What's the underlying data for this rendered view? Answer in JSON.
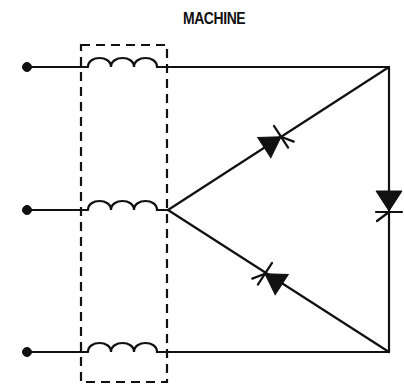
{
  "title": "MACHINE",
  "diagram": {
    "type": "circuit-schematic",
    "components": {
      "terminals": [
        {
          "id": "T1",
          "x": 27,
          "y": 67
        },
        {
          "id": "T2",
          "x": 27,
          "y": 210
        },
        {
          "id": "T3",
          "x": 27,
          "y": 352
        }
      ],
      "windings": [
        {
          "id": "L1",
          "x1": 88,
          "x2": 162,
          "y": 67,
          "turns": 3
        },
        {
          "id": "L2",
          "x1": 88,
          "x2": 162,
          "y": 210,
          "turns": 3
        },
        {
          "id": "L3",
          "x1": 88,
          "x2": 162,
          "y": 352,
          "turns": 3
        }
      ],
      "machine_boundary": {
        "x": 81,
        "y": 45,
        "width": 86,
        "height": 337,
        "style": "dashed"
      },
      "thyristors": [
        {
          "id": "SCR1",
          "branch": "middle-node to top-right",
          "orientation": "up-right"
        },
        {
          "id": "SCR2",
          "branch": "top-right to bottom-right",
          "orientation": "down"
        },
        {
          "id": "SCR3",
          "branch": "bottom-right to middle-node",
          "orientation": "up-left"
        }
      ]
    },
    "colors": {
      "stroke": "#111111",
      "background": "#ffffff"
    }
  }
}
